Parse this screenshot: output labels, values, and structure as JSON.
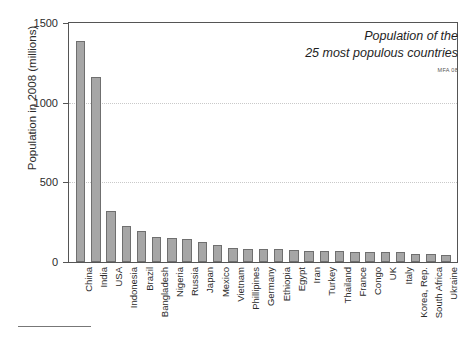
{
  "chart_data": {
    "type": "bar",
    "title": "Population of the\n25 most populous countries",
    "title_line1": "Population of the",
    "title_line2": "25 most populous countries",
    "credit": "MFA 08",
    "xlabel": "",
    "ylabel": "Population in 2008  (millions)",
    "ylim": [
      0,
      1500
    ],
    "yticks": [
      0,
      500,
      1000,
      1500
    ],
    "ytick_labels": [
      "0",
      "500",
      "1000",
      "1500"
    ],
    "grid": "horizontal-dotted at 500 and 1000",
    "legend": "none",
    "categories": [
      "China",
      "India",
      "USA",
      "Indonesia",
      "Brazil",
      "Bangladesh",
      "Nigeria",
      "Russia",
      "Japan",
      "Mexico",
      "Vietnam",
      "Phillipines",
      "Germany",
      "Ethiopia",
      "Egypt",
      "Iran",
      "Turkey",
      "Thailand",
      "France",
      "Congo",
      "UK",
      "Italy",
      "Korea, Rep.",
      "South Africa",
      "Ukraine"
    ],
    "values": [
      1390,
      1160,
      318,
      228,
      192,
      160,
      151,
      142,
      128,
      106,
      86,
      84,
      82,
      80,
      75,
      72,
      71,
      67,
      62,
      62,
      61,
      60,
      48,
      48,
      46
    ]
  },
  "axes": {
    "y_title": "Population in 2008  (millions)"
  }
}
